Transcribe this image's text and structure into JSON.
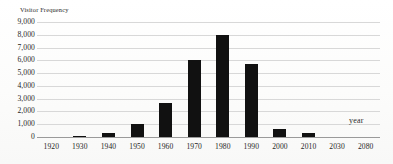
{
  "chart_data": {
    "type": "bar",
    "title": "",
    "xlabel": "year",
    "ylabel": "Visitor Frequency",
    "categories": [
      "1920",
      "1930",
      "1940",
      "1950",
      "1960",
      "1970",
      "1980",
      "1990",
      "2000",
      "2010",
      "2030",
      "2080"
    ],
    "values": [
      0,
      60,
      350,
      980,
      2700,
      6000,
      7980,
      5700,
      620,
      300,
      0,
      0
    ],
    "ylim": [
      0,
      9000
    ],
    "ytick_values": [
      9000,
      8000,
      7000,
      6000,
      5000,
      4000,
      3000,
      2000,
      1000,
      0
    ],
    "ytick_labels": [
      "9,000",
      "8,000",
      "7,000",
      "6,000",
      "5,000",
      "4,000",
      "3,000",
      "2,000",
      "1,000",
      "0"
    ],
    "grid": true,
    "legend": false,
    "bar_color": "#111111",
    "gridline_color": "#d8d8d8",
    "axis_color": "#9a9a9a"
  }
}
